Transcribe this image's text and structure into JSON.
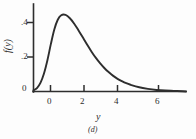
{
  "figure": {
    "caption": "(d)",
    "background_color": "#fdfdfd",
    "ink_color": "#2e2e2e"
  },
  "chart_data": {
    "type": "line",
    "title": "",
    "subtitle": "",
    "xlabel": "y",
    "ylabel": "f(y)",
    "annotation": "(d)",
    "legend": [],
    "legend_position": "none",
    "grid": false,
    "xlim": [
      -1.6,
      7.2
    ],
    "ylim": [
      0,
      0.56
    ],
    "xticks": [
      0,
      2,
      4,
      6
    ],
    "xtick_labels": [
      "0",
      "2",
      "4",
      "6"
    ],
    "yticks": [
      0,
      0.2,
      0.4
    ],
    "ytick_labels": [
      "0",
      ".2",
      ".4"
    ],
    "series": [
      {
        "name": "f(y)",
        "description": "extreme-value (Gumbel) probability density",
        "color": "#2e2e2e",
        "x": [
          -1.6,
          -1.4,
          -1.2,
          -1.0,
          -0.8,
          -0.6,
          -0.4,
          -0.2,
          0.0,
          0.25,
          0.5,
          0.75,
          1.0,
          1.25,
          1.5,
          1.75,
          2.0,
          2.25,
          2.5,
          2.75,
          3.0,
          3.25,
          3.5,
          3.75,
          4.0,
          4.5,
          5.0,
          5.5,
          6.0,
          6.5,
          7.0
        ],
        "y": [
          0.007,
          0.022,
          0.055,
          0.114,
          0.199,
          0.303,
          0.397,
          0.459,
          0.488,
          0.49,
          0.469,
          0.434,
          0.391,
          0.345,
          0.299,
          0.255,
          0.215,
          0.18,
          0.149,
          0.123,
          0.1,
          0.081,
          0.066,
          0.053,
          0.043,
          0.027,
          0.017,
          0.01,
          0.006,
          0.004,
          0.002
        ]
      }
    ],
    "peak": {
      "x": -0.05,
      "y": 0.49
    }
  }
}
